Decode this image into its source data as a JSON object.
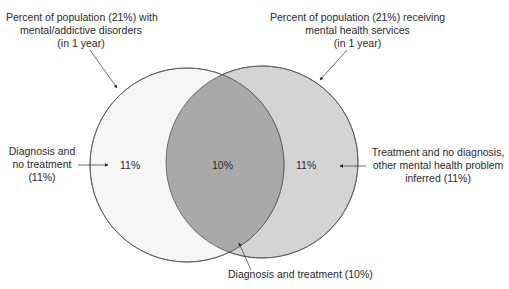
{
  "diagram": {
    "type": "venn",
    "sets": [
      {
        "id": "disorders",
        "label_lines": [
          "Percent of population (21%) with",
          "mental/addictive disorders",
          "(in 1 year)"
        ],
        "fill": "#f6f6f6"
      },
      {
        "id": "services",
        "label_lines": [
          "Percent of population (21%) receiving",
          "mental health services",
          "(in 1 year)"
        ],
        "fill": "#d4d4d4"
      }
    ],
    "regions": [
      {
        "id": "diagnosis-no-treatment",
        "value": "11%",
        "callout_lines": [
          "Diagnosis and",
          "no treatment",
          "(11%)"
        ]
      },
      {
        "id": "diagnosis-and-treatment",
        "value": "10%",
        "callout_lines": [
          "Diagnosis and treatment (10%)"
        ],
        "fill": "#a9a9a9"
      },
      {
        "id": "treatment-no-diagnosis",
        "value": "11%",
        "callout_lines": [
          "Treatment and no diagnosis,",
          "other mental health problem",
          "inferred (11%)"
        ]
      }
    ],
    "colors": {
      "stroke": "#555555",
      "text": "#2a2a2a",
      "arrow": "#222222"
    }
  }
}
